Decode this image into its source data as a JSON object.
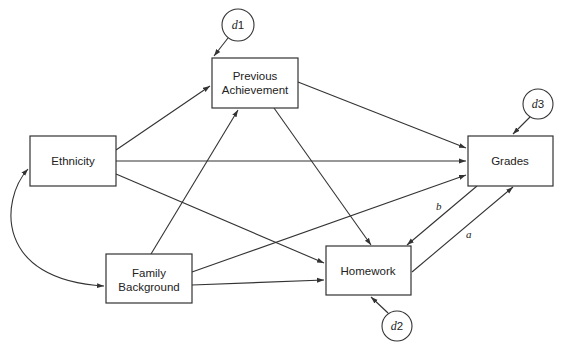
{
  "diagram": {
    "type": "path-model",
    "nodes": {
      "previous_achievement": {
        "line1": "Previous",
        "line2": "Achievement"
      },
      "ethnicity": {
        "label": "Ethnicity"
      },
      "family_background": {
        "line1": "Family",
        "line2": "Background"
      },
      "homework": {
        "label": "Homework"
      },
      "grades": {
        "label": "Grades"
      }
    },
    "disturbances": {
      "d1": {
        "letter": "d",
        "number": "1",
        "target": "Previous Achievement"
      },
      "d2": {
        "letter": "d",
        "number": "2",
        "target": "Homework"
      },
      "d3": {
        "letter": "d",
        "number": "3",
        "target": "Grades"
      }
    },
    "paths": [
      {
        "from": "Ethnicity",
        "to": "Previous Achievement"
      },
      {
        "from": "Ethnicity",
        "to": "Grades"
      },
      {
        "from": "Ethnicity",
        "to": "Homework"
      },
      {
        "from": "Family Background",
        "to": "Previous Achievement"
      },
      {
        "from": "Family Background",
        "to": "Grades"
      },
      {
        "from": "Family Background",
        "to": "Homework"
      },
      {
        "from": "Previous Achievement",
        "to": "Grades"
      },
      {
        "from": "Previous Achievement",
        "to": "Homework"
      },
      {
        "from": "Homework",
        "to": "Grades",
        "label": "a"
      },
      {
        "from": "Grades",
        "to": "Homework",
        "label": "b"
      }
    ],
    "correlations": [
      {
        "between": [
          "Ethnicity",
          "Family Background"
        ]
      }
    ],
    "path_labels": {
      "a": "a",
      "b": "b"
    }
  }
}
